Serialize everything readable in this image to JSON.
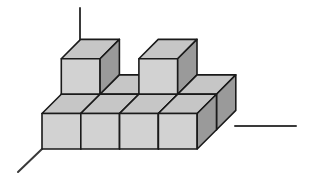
{
  "figure": {
    "background_color": "#ffffff",
    "width": 310,
    "height": 176
  },
  "colors": {
    "face_top": "#c6c6c6",
    "face_front": "#d2d2d2",
    "face_side": "#9a9a9a",
    "edge": "#1a1a1a",
    "axis": "#3a3a3a",
    "background": "#ffffff"
  },
  "projection": {
    "origin_x": 42,
    "origin_y": 149,
    "unit_x": 38.8,
    "unit_y": 35.5,
    "depth_dx": 19.3,
    "depth_dy": -19.3,
    "edge_width": 1.6,
    "axis_width": 2.0
  },
  "geometry": {
    "base_rows": 2,
    "base_columns": 4,
    "raised_cube_count": 2,
    "total_cubes_visible": 10,
    "note": "4 x 2 base layer with two cubes raised on the back row"
  },
  "cubes": [
    {
      "name": "base-front-col1",
      "col": 0,
      "row": 0,
      "level": 0
    },
    {
      "name": "base-front-col2",
      "col": 1,
      "row": 0,
      "level": 0
    },
    {
      "name": "base-front-col3",
      "col": 2,
      "row": 0,
      "level": 0
    },
    {
      "name": "base-front-col4",
      "col": 3,
      "row": 0,
      "level": 0
    },
    {
      "name": "base-back-col1",
      "col": 0,
      "row": 1,
      "level": 0
    },
    {
      "name": "base-back-col2",
      "col": 1,
      "row": 1,
      "level": 0
    },
    {
      "name": "base-back-col3",
      "col": 2,
      "row": 1,
      "level": 0
    },
    {
      "name": "base-back-col4",
      "col": 3,
      "row": 1,
      "level": 0
    },
    {
      "name": "raised-cube-left",
      "col": 0,
      "row": 1,
      "level": 1
    },
    {
      "name": "raised-cube-right",
      "col": 2,
      "row": 1,
      "level": 1
    }
  ],
  "axes": [
    {
      "name": "vertical-axis",
      "label": "z",
      "x1": 80,
      "y1": 8,
      "x2": 80,
      "y2": 43
    },
    {
      "name": "depth-axis-lower-left",
      "label": "y",
      "x1": 42,
      "y1": 149,
      "x2": 18,
      "y2": 172
    },
    {
      "name": "horizontal-axis-right",
      "label": "x",
      "x1": 235,
      "y1": 126,
      "x2": 296,
      "y2": 126
    }
  ]
}
